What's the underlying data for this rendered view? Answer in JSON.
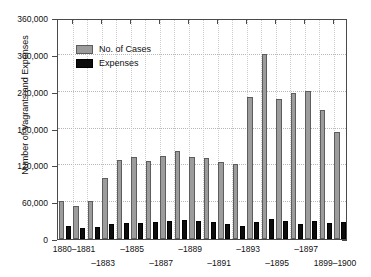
{
  "chart_data": {
    "type": "bar",
    "title": "",
    "xlabel": "",
    "ylabel": "Number of Vagrants and Expenses",
    "ylim": [
      0,
      360000
    ],
    "ytick_values": [
      0,
      60000,
      120000,
      180000,
      240000,
      300000,
      360000
    ],
    "ytick_labels": [
      "0",
      "60,000",
      "120,000",
      "180,000",
      "240,000",
      "300,000",
      "360,000"
    ],
    "grid": true,
    "legend_position": "upper-left-inside",
    "categories": [
      "1880–1881",
      "1881–1882",
      "1882–1883",
      "1883–1884",
      "1884–1885",
      "1885–1886",
      "1886–1887",
      "1887–1888",
      "1888–1889",
      "1889–1890",
      "1890–1891",
      "1891–1892",
      "1892–1893",
      "1893–1894",
      "1894–1895",
      "1895–1896",
      "1896–1897",
      "1897–1898",
      "1898–1899",
      "1899–1900"
    ],
    "xtick_labels": [
      {
        "text": "1880–1881",
        "index": 0,
        "row": 0
      },
      {
        "text": "–1883",
        "index": 2,
        "row": 1
      },
      {
        "text": "–1885",
        "index": 4,
        "row": 0
      },
      {
        "text": "–1887",
        "index": 6,
        "row": 1
      },
      {
        "text": "–1889",
        "index": 8,
        "row": 0
      },
      {
        "text": "–1891",
        "index": 10,
        "row": 1
      },
      {
        "text": "–1893",
        "index": 12,
        "row": 0
      },
      {
        "text": "–1895",
        "index": 14,
        "row": 1
      },
      {
        "text": "–1897",
        "index": 16,
        "row": 0
      },
      {
        "text": "1899–1900",
        "index": 18,
        "row": 1
      }
    ],
    "series": [
      {
        "name": "No. of Cases",
        "color": "#9c9c9c",
        "values": [
          62000,
          53000,
          62000,
          100000,
          128000,
          133000,
          127000,
          135000,
          143000,
          133000,
          132000,
          126000,
          122000,
          231000,
          301000,
          228000,
          238000,
          241000,
          210000,
          174000
        ]
      },
      {
        "name": "Expenses",
        "color": "#0d0d0d",
        "values": [
          21000,
          18000,
          19000,
          25000,
          26000,
          26000,
          28000,
          30000,
          31000,
          29000,
          27000,
          25000,
          21000,
          28000,
          33000,
          29000,
          24000,
          30000,
          26000,
          27000
        ]
      }
    ]
  },
  "legend": {
    "items": [
      {
        "label": "No. of Cases"
      },
      {
        "label": "Expenses"
      }
    ]
  }
}
